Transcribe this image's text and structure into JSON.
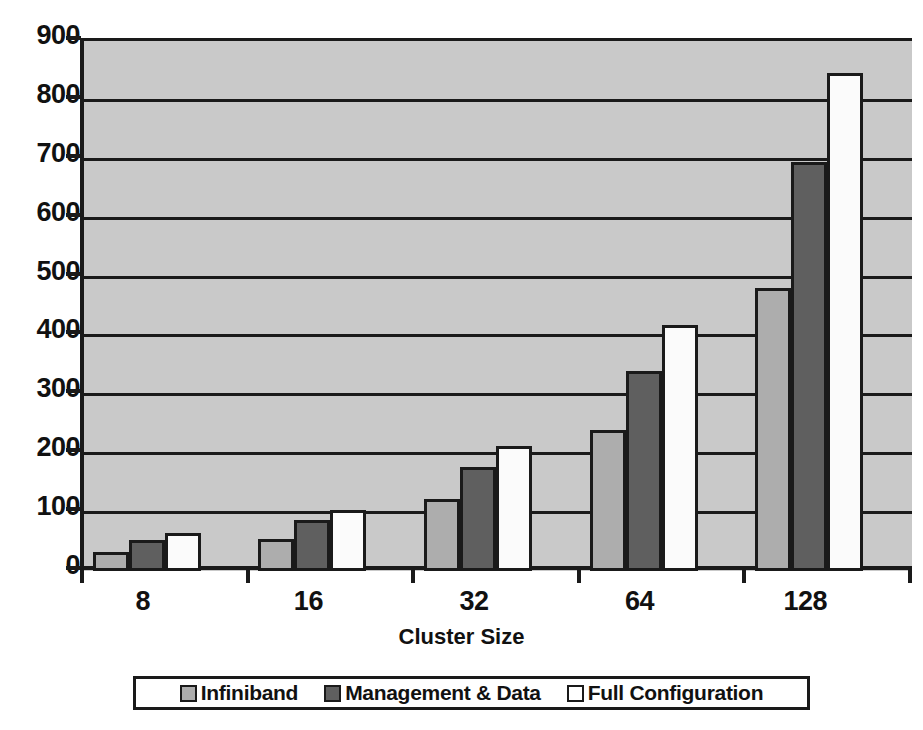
{
  "chart_data": {
    "type": "bar",
    "title": "",
    "xlabel": "Cluster Size",
    "ylabel": "",
    "categories": [
      "8",
      "16",
      "32",
      "64",
      "128"
    ],
    "series": [
      {
        "name": "Infiniband",
        "color": "#adadad",
        "values": [
          32,
          55,
          122,
          240,
          480
        ]
      },
      {
        "name": "Management & Data",
        "color": "#5f5f5f",
        "values": [
          52,
          86,
          177,
          340,
          695
        ]
      },
      {
        "name": "Full Configuration",
        "color": "#ffffff",
        "values": [
          65,
          104,
          212,
          417,
          845
        ]
      }
    ],
    "ylim": [
      0,
      900
    ],
    "ytick_labels": [
      "900",
      "800",
      "700",
      "600",
      "500",
      "400",
      "300",
      "200",
      "100",
      "0"
    ],
    "ytick_values": [
      900,
      800,
      700,
      600,
      500,
      400,
      300,
      200,
      100,
      0
    ],
    "grid": true,
    "legend_position": "bottom",
    "plot_background": "#c9c9c9",
    "axis_color": "#1a1a1a"
  },
  "legend": {
    "entries": [
      {
        "label": "Infiniband"
      },
      {
        "label": "Management & Data"
      },
      {
        "label": "Full Configuration"
      }
    ]
  },
  "axis": {
    "x_title": "Cluster Size"
  }
}
